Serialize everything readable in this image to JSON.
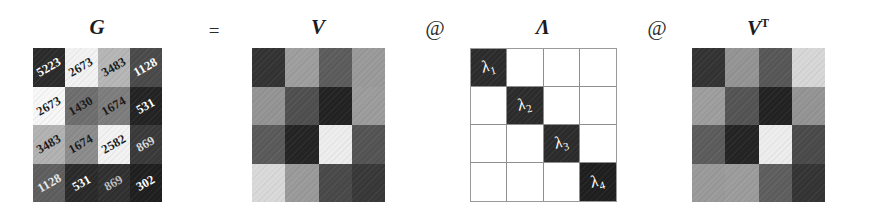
{
  "figure": {
    "type": "matrix-equation-diagram"
  },
  "equation": {
    "terms": [
      {
        "label": "G",
        "superscript": ""
      },
      {
        "label": "V",
        "superscript": ""
      },
      {
        "label": "Λ",
        "superscript": ""
      },
      {
        "label": "V",
        "superscript": "T"
      }
    ],
    "operators": [
      {
        "name": "equals",
        "symbol": "="
      },
      {
        "name": "matmul-1",
        "symbol": "@"
      },
      {
        "name": "matmul-2",
        "symbol": "@"
      }
    ]
  },
  "matrices": [
    {
      "name": "G",
      "label": "G",
      "superscript": "",
      "kind": "values",
      "gridlines": false,
      "rows": [
        [
          {
            "value": "5223",
            "shade": "#2b2b2b",
            "text": "#ffffff"
          },
          {
            "value": "2673",
            "shade": "#f2f2f2",
            "text": "#1a1a1a"
          },
          {
            "value": "3483",
            "shade": "#b6b6b6",
            "text": "#1a1a1a"
          },
          {
            "value": "1128",
            "shade": "#4a4a4a",
            "text": "#ffffff"
          }
        ],
        [
          {
            "value": "2673",
            "shade": "#f7f7f7",
            "text": "#1a1a1a"
          },
          {
            "value": "1430",
            "shade": "#6e6e6e",
            "text": "#1a1a1a"
          },
          {
            "value": "1674",
            "shade": "#7d7d7d",
            "text": "#1a1a1a"
          },
          {
            "value": "531",
            "shade": "#232323",
            "text": "#ffffff"
          }
        ],
        [
          {
            "value": "3483",
            "shade": "#b2b2b2",
            "text": "#1a1a1a"
          },
          {
            "value": "1674",
            "shade": "#8c8c8c",
            "text": "#1a1a1a"
          },
          {
            "value": "2582",
            "shade": "#f2f2f2",
            "text": "#1a1a1a"
          },
          {
            "value": "869",
            "shade": "#3a3a3a",
            "text": "#d8d8d8"
          }
        ],
        [
          {
            "value": "1128",
            "shade": "#5e5e5e",
            "text": "#e8e8e8"
          },
          {
            "value": "531",
            "shade": "#2a2a2a",
            "text": "#ffffff"
          },
          {
            "value": "869",
            "shade": "#303030",
            "text": "#bdbdbd"
          },
          {
            "value": "302",
            "shade": "#1f1f1f",
            "text": "#ffffff"
          }
        ]
      ]
    },
    {
      "name": "V",
      "label": "V",
      "superscript": "",
      "kind": "shades",
      "gridlines": false,
      "rows": [
        [
          {
            "value": "",
            "shade": "#333333",
            "text": "#ffffff"
          },
          {
            "value": "",
            "shade": "#9e9e9e",
            "text": "#1a1a1a"
          },
          {
            "value": "",
            "shade": "#5c5c5c",
            "text": "#ffffff"
          },
          {
            "value": "",
            "shade": "#9a9a9a",
            "text": "#1a1a1a"
          }
        ],
        [
          {
            "value": "",
            "shade": "#949494",
            "text": "#1a1a1a"
          },
          {
            "value": "",
            "shade": "#4f4f4f",
            "text": "#ffffff"
          },
          {
            "value": "",
            "shade": "#222222",
            "text": "#ffffff"
          },
          {
            "value": "",
            "shade": "#9c9c9c",
            "text": "#1a1a1a"
          }
        ],
        [
          {
            "value": "",
            "shade": "#5a5a5a",
            "text": "#ffffff"
          },
          {
            "value": "",
            "shade": "#242424",
            "text": "#ffffff"
          },
          {
            "value": "",
            "shade": "#ededed",
            "text": "#1a1a1a"
          },
          {
            "value": "",
            "shade": "#545454",
            "text": "#ffffff"
          }
        ],
        [
          {
            "value": "",
            "shade": "#d9d9d9",
            "text": "#1a1a1a"
          },
          {
            "value": "",
            "shade": "#9a9a9a",
            "text": "#1a1a1a"
          },
          {
            "value": "",
            "shade": "#494949",
            "text": "#ffffff"
          },
          {
            "value": "",
            "shade": "#383838",
            "text": "#ffffff"
          }
        ]
      ]
    },
    {
      "name": "Lambda",
      "label": "Λ",
      "superscript": "",
      "kind": "diagonal",
      "gridlines": true,
      "rows": [
        [
          {
            "value": "λ",
            "sub": "1",
            "shade": "#2c2c2c",
            "text": "#ffffff"
          },
          {
            "value": "",
            "sub": "",
            "shade": "#ffffff",
            "text": "#1a1a1a"
          },
          {
            "value": "",
            "sub": "",
            "shade": "#ffffff",
            "text": "#1a1a1a"
          },
          {
            "value": "",
            "sub": "",
            "shade": "#ffffff",
            "text": "#1a1a1a"
          }
        ],
        [
          {
            "value": "",
            "sub": "",
            "shade": "#ffffff",
            "text": "#1a1a1a"
          },
          {
            "value": "λ",
            "sub": "2",
            "shade": "#2c2c2c",
            "text": "#ffffff"
          },
          {
            "value": "",
            "sub": "",
            "shade": "#ffffff",
            "text": "#1a1a1a"
          },
          {
            "value": "",
            "sub": "",
            "shade": "#ffffff",
            "text": "#1a1a1a"
          }
        ],
        [
          {
            "value": "",
            "sub": "",
            "shade": "#ffffff",
            "text": "#1a1a1a"
          },
          {
            "value": "",
            "sub": "",
            "shade": "#ffffff",
            "text": "#1a1a1a"
          },
          {
            "value": "λ",
            "sub": "3",
            "shade": "#2c2c2c",
            "text": "#ffffff"
          },
          {
            "value": "",
            "sub": "",
            "shade": "#ffffff",
            "text": "#1a1a1a"
          }
        ],
        [
          {
            "value": "",
            "sub": "",
            "shade": "#ffffff",
            "text": "#1a1a1a"
          },
          {
            "value": "",
            "sub": "",
            "shade": "#ffffff",
            "text": "#1a1a1a"
          },
          {
            "value": "",
            "sub": "",
            "shade": "#ffffff",
            "text": "#1a1a1a"
          },
          {
            "value": "λ",
            "sub": "4",
            "shade": "#1f1f1f",
            "text": "#ffffff"
          }
        ]
      ]
    },
    {
      "name": "V-transpose",
      "label": "V",
      "superscript": "T",
      "kind": "shades",
      "gridlines": false,
      "rows": [
        [
          {
            "value": "",
            "shade": "#333333",
            "text": "#ffffff"
          },
          {
            "value": "",
            "shade": "#949494",
            "text": "#1a1a1a"
          },
          {
            "value": "",
            "shade": "#575757",
            "text": "#ffffff"
          },
          {
            "value": "",
            "shade": "#d7d7d7",
            "text": "#1a1a1a"
          }
        ],
        [
          {
            "value": "",
            "shade": "#9e9e9e",
            "text": "#1a1a1a"
          },
          {
            "value": "",
            "shade": "#545454",
            "text": "#ffffff"
          },
          {
            "value": "",
            "shade": "#222222",
            "text": "#ffffff"
          },
          {
            "value": "",
            "shade": "#949494",
            "text": "#1a1a1a"
          }
        ],
        [
          {
            "value": "",
            "shade": "#5c5c5c",
            "text": "#ffffff"
          },
          {
            "value": "",
            "shade": "#242424",
            "text": "#ffffff"
          },
          {
            "value": "",
            "shade": "#ededed",
            "text": "#1a1a1a"
          },
          {
            "value": "",
            "shade": "#4a4a4a",
            "text": "#ffffff"
          }
        ],
        [
          {
            "value": "",
            "shade": "#9a9a9a",
            "text": "#1a1a1a"
          },
          {
            "value": "",
            "shade": "#9c9c9c",
            "text": "#1a1a1a"
          },
          {
            "value": "",
            "shade": "#5e5e5e",
            "text": "#ffffff"
          },
          {
            "value": "",
            "shade": "#343434",
            "text": "#ffffff"
          }
        ]
      ]
    }
  ]
}
